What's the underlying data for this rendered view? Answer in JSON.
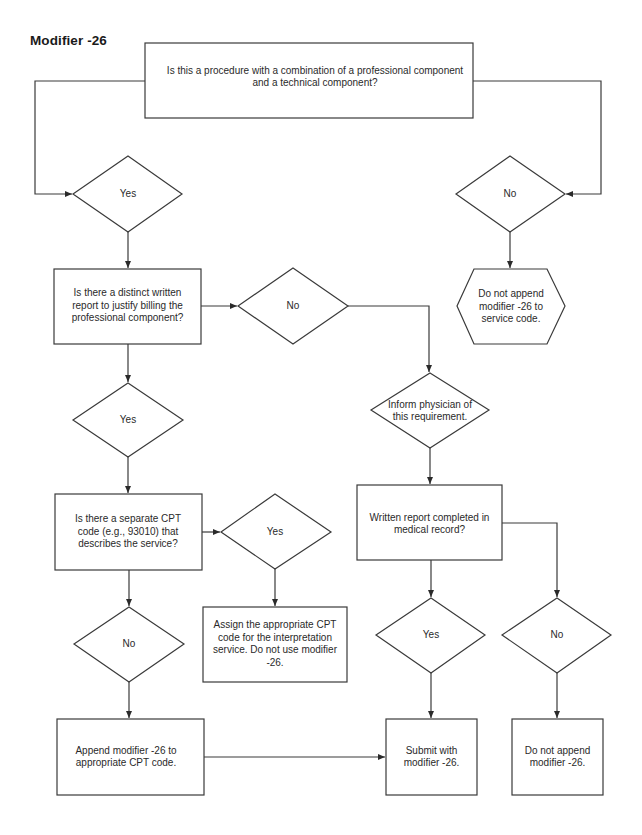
{
  "title": "Modifier -26",
  "nodes": {
    "q_combination": {
      "type": "process",
      "text": "Is this a procedure with a combination of a professional component and a technical component?"
    },
    "yes_1": {
      "type": "decision",
      "text": "Yes"
    },
    "no_1": {
      "type": "decision",
      "text": "No"
    },
    "do_not_append_service": {
      "type": "preparation",
      "text": "Do not append modifier -26 to service code."
    },
    "q_written_report": {
      "type": "process",
      "text": "Is there a distinct written report to justify billing the professional component?"
    },
    "no_2": {
      "type": "decision",
      "text": "No"
    },
    "inform_physician": {
      "type": "decision",
      "text": "Inform physician of this requirement."
    },
    "yes_2": {
      "type": "decision",
      "text": "Yes"
    },
    "q_separate_cpt": {
      "type": "process",
      "text": "Is there a separate CPT code (e.g., 93010) that describes the service?"
    },
    "yes_3": {
      "type": "decision",
      "text": "Yes"
    },
    "assign_cpt": {
      "type": "process",
      "text": "Assign the appropriate CPT code for the interpretation service. Do not use modifier -26."
    },
    "q_report_completed": {
      "type": "process",
      "text": "Written report completed in medical record?"
    },
    "no_3": {
      "type": "decision",
      "text": "No"
    },
    "yes_4": {
      "type": "decision",
      "text": "Yes"
    },
    "no_4": {
      "type": "decision",
      "text": "No"
    },
    "append_modifier": {
      "type": "process",
      "text": "Append modifier -26 to appropriate CPT code."
    },
    "submit_modifier": {
      "type": "process",
      "text": "Submit with modifier -26."
    },
    "do_not_append": {
      "type": "process",
      "text": "Do not append modifier -26."
    }
  },
  "edges": [
    [
      "q_combination",
      "yes_1"
    ],
    [
      "q_combination",
      "no_1"
    ],
    [
      "no_1",
      "do_not_append_service"
    ],
    [
      "yes_1",
      "q_written_report"
    ],
    [
      "q_written_report",
      "no_2"
    ],
    [
      "no_2",
      "inform_physician"
    ],
    [
      "inform_physician",
      "q_report_completed"
    ],
    [
      "q_written_report",
      "yes_2"
    ],
    [
      "yes_2",
      "q_separate_cpt"
    ],
    [
      "q_separate_cpt",
      "yes_3"
    ],
    [
      "yes_3",
      "assign_cpt"
    ],
    [
      "q_separate_cpt",
      "no_4"
    ],
    [
      "no_4",
      "append_modifier"
    ],
    [
      "append_modifier",
      "submit_modifier"
    ],
    [
      "q_report_completed",
      "yes_4"
    ],
    [
      "yes_4",
      "submit_modifier"
    ],
    [
      "q_report_completed",
      "no_3"
    ],
    [
      "no_3",
      "do_not_append"
    ]
  ],
  "colors": {
    "stroke": "#3a3a3a",
    "text": "#2a2a2a",
    "background": "#ffffff"
  }
}
